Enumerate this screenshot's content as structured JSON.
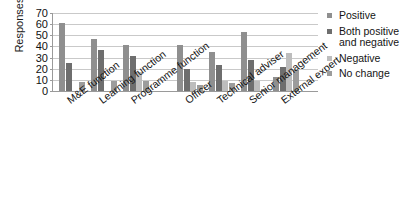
{
  "chart_data": {
    "type": "bar",
    "title": "",
    "xlabel": "",
    "ylabel": "Responses (%)",
    "ylim": [
      0,
      70
    ],
    "ytick_labels": [
      "70",
      "60",
      "50",
      "40",
      "30",
      "20",
      "10",
      "0"
    ],
    "ytick_values": [
      70,
      60,
      50,
      40,
      30,
      20,
      10,
      0
    ],
    "grid": true,
    "legend_position": "right",
    "group_gap_after_index": 2,
    "categories": [
      "M&E function",
      "Learning function",
      "Programme function",
      "Officer",
      "Technical adviser",
      "Senior management",
      "External expert"
    ],
    "series": [
      {
        "name": "Positive",
        "color": "#8f8f8f",
        "values": [
          61,
          47,
          41,
          41,
          35,
          53,
          13
        ]
      },
      {
        "name": "Both positive and negative",
        "color": "#6e6e6e",
        "values": [
          25,
          37,
          31,
          20,
          23,
          28,
          22
        ]
      },
      {
        "name": "Negative",
        "color": "#bdbdbd",
        "values": [
          0,
          0,
          17,
          8,
          9,
          9,
          34
        ]
      },
      {
        "name": "No change",
        "color": "#9c9c9c",
        "values": [
          8,
          9,
          9,
          5,
          7,
          2,
          19
        ]
      }
    ]
  },
  "legend": {
    "items": [
      {
        "label": "Positive",
        "color": "#8f8f8f"
      },
      {
        "label": "Both positive and negative",
        "color": "#6e6e6e"
      },
      {
        "label": "Negative",
        "color": "#bdbdbd"
      },
      {
        "label": "No change",
        "color": "#9c9c9c"
      }
    ]
  },
  "axes": {
    "y_title": "Responses (%)"
  }
}
